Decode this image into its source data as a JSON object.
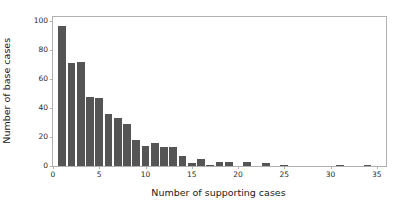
{
  "chart_data": {
    "type": "bar",
    "title": "",
    "subtitle": "",
    "xlabel": "Number of supporting cases",
    "ylabel": "Number of base cases",
    "xlim": [
      0,
      36
    ],
    "ylim": [
      0,
      103
    ],
    "xticks": [
      0,
      5,
      10,
      15,
      20,
      25,
      30,
      35
    ],
    "yticks": [
      0,
      20,
      40,
      60,
      80,
      100
    ],
    "xtick_labels": [
      "0",
      "5",
      "10",
      "15",
      "20",
      "25",
      "30",
      "35"
    ],
    "ytick_labels": [
      "0",
      "20",
      "40",
      "60",
      "80",
      "100"
    ],
    "grid": false,
    "legend": null,
    "bar_color": "#555555",
    "bar_width": 0.82,
    "categories": [
      1,
      2,
      3,
      4,
      5,
      6,
      7,
      8,
      9,
      10,
      11,
      12,
      13,
      14,
      15,
      16,
      17,
      18,
      19,
      21,
      23,
      25,
      31,
      34
    ],
    "values": [
      97,
      71,
      72,
      48,
      47,
      36,
      33,
      29,
      18,
      14,
      16,
      13,
      13,
      7,
      2,
      5,
      1,
      3,
      3,
      3,
      2,
      1,
      1,
      1
    ],
    "series": [
      {
        "name": "base cases",
        "x": [
          1,
          2,
          3,
          4,
          5,
          6,
          7,
          8,
          9,
          10,
          11,
          12,
          13,
          14,
          15,
          16,
          17,
          18,
          19,
          21,
          23,
          25,
          31,
          34
        ],
        "values": [
          97,
          71,
          72,
          48,
          47,
          36,
          33,
          29,
          18,
          14,
          16,
          13,
          13,
          7,
          2,
          5,
          1,
          3,
          3,
          3,
          2,
          1,
          1,
          1
        ]
      }
    ],
    "annotations": []
  },
  "figure": {
    "background_color": "#ffffff",
    "axes_edge_color": "#b0b0b0"
  }
}
